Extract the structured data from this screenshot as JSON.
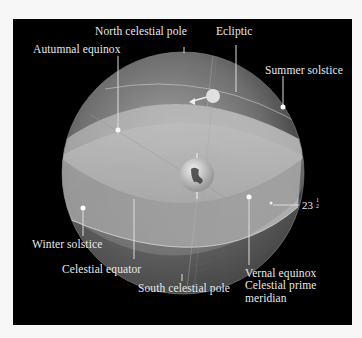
{
  "figure": {
    "colors": {
      "background": "#000000",
      "page": "#f7f7f7",
      "label_text": "#e8e8e8",
      "sphere_light": "#c8c8c8",
      "sphere_dark": "#4a4a4a"
    },
    "labels": {
      "north_celestial_pole": "North celestial pole",
      "ecliptic": "Ecliptic",
      "autumnal_equinox": "Autumnal equinox",
      "summer_solstice": "Summer solstice",
      "winter_solstice": "Winter solstice",
      "celestial_equator": "Celestial equator",
      "south_celestial_pole": "South celestial pole",
      "vernal_equinox": "Vernal equinox",
      "celestial_prime_meridian": "Celestial prime\nmeridian",
      "tilt_angle": {
        "whole": "23",
        "numerator": "1",
        "denominator": "2"
      }
    },
    "objects": {
      "center": "earth",
      "sun": "sun-on-ecliptic"
    }
  }
}
